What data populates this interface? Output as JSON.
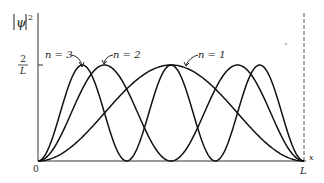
{
  "chart_data": {
    "type": "line",
    "title": "",
    "xlabel": "x",
    "ylabel": "|ψ|²",
    "x_ticks": [
      "0",
      "L"
    ],
    "y_ticks": [
      "2/L"
    ],
    "xlim": [
      0,
      1
    ],
    "ylim": [
      0,
      2.6
    ],
    "grid": false,
    "legend": "inline annotations with arrows",
    "formula": "|ψ_n|² = (2/L) sin²(nπx/L)",
    "series": [
      {
        "name": "n = 1",
        "n": 1,
        "peaks_at": [
          0.5
        ],
        "peak_value": "2/L"
      },
      {
        "name": "n = 2",
        "n": 2,
        "peaks_at": [
          0.25,
          0.75
        ],
        "peak_value": "2/L"
      },
      {
        "name": "n = 3",
        "n": 3,
        "peaks_at": [
          0.1667,
          0.5,
          0.8333
        ],
        "peak_value": "2/L"
      }
    ],
    "annotations": [
      "n = 3",
      "n = 2",
      "n = 1"
    ]
  },
  "labels": {
    "ylabel_psi": "ψ",
    "ylabel_sup": "2",
    "tick_num": "2",
    "tick_den": "L",
    "origin": "0",
    "xend": "L",
    "xaxis": "x",
    "n1": "n = 1",
    "n2": "n = 2",
    "n3": "n = 3"
  }
}
